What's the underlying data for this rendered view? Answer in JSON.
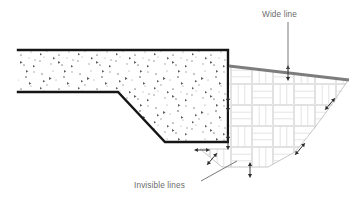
{
  "diagram": {
    "background_color": "#ffffff",
    "annotations": [
      {
        "id": "wide-line",
        "label": "Wide line",
        "text_x": 262,
        "text_y": 17,
        "leader": "M288,22 L288,72",
        "color": "#6b6b6b"
      },
      {
        "id": "invisible-lines",
        "label": "Invisible lines",
        "text_x": 134,
        "text_y": 188,
        "leader": "M201,181 L237,161",
        "color": "#6b6b6b"
      }
    ],
    "regions": [
      {
        "id": "concrete-slab",
        "name": "concrete-slab",
        "fill": "#ffffff",
        "outline_color": "#151515",
        "outline_width": 2.4,
        "path": "M18,50 L228,50 L228,142 L165,142 L118,92 L18,92",
        "hatch": "concrete-aggregate"
      },
      {
        "id": "masonry-fill",
        "name": "parquet-masonry-fill",
        "fill": "#ffffff",
        "outline_color": "#bdbdbd",
        "outline_width": 0.8,
        "path": "M230,66 L348,80 C330,108 312,132 295,152 L268,167 L222,167 L200,149 L228,149 L228,66 Z",
        "hatch": "basketweave-parquet"
      }
    ],
    "wide_line": {
      "name": "wide-line-stroke",
      "color": "#7d7d7d",
      "width": 3.0,
      "path": "M229,66 L349,80"
    },
    "invisible_line_paths": [
      "M348,80 C330,108 312,132 295,152",
      "M295,152 L268,167",
      "M268,167 L222,167",
      "M222,167 L200,149",
      "M200,149 L228,149"
    ],
    "invisible_line_color": "#c3c3c3",
    "arrow_markers": [
      {
        "id": "arrow-right-edge-mid",
        "x": 228,
        "y": 104,
        "angle": 0
      },
      {
        "id": "arrow-wide-line-mid",
        "x": 288,
        "y": 73,
        "angle": 0
      },
      {
        "id": "arrow-bottom-edge",
        "x": 228,
        "y": 142,
        "angle": 0
      },
      {
        "id": "arrow-bottom-left-small",
        "x": 202,
        "y": 150,
        "angle": 90
      },
      {
        "id": "arrow-curve-upper",
        "x": 330,
        "y": 104,
        "angle": 40
      },
      {
        "id": "arrow-curve-lower",
        "x": 300,
        "y": 149,
        "angle": 40
      },
      {
        "id": "arrow-bottom-slope-left",
        "x": 212,
        "y": 159,
        "angle": 40
      },
      {
        "id": "arrow-bottom-center",
        "x": 250,
        "y": 170,
        "angle": 0
      }
    ],
    "arrow_color": "#2a2a2a",
    "parquet": {
      "block": 21,
      "slat_lines": 3,
      "line_color": "#d9d9d9",
      "line_width": 0.75
    },
    "concrete_hatch": {
      "dot_color": "#8a8a8a",
      "triangle_color": "#5c5c5c",
      "density": "medium"
    }
  }
}
